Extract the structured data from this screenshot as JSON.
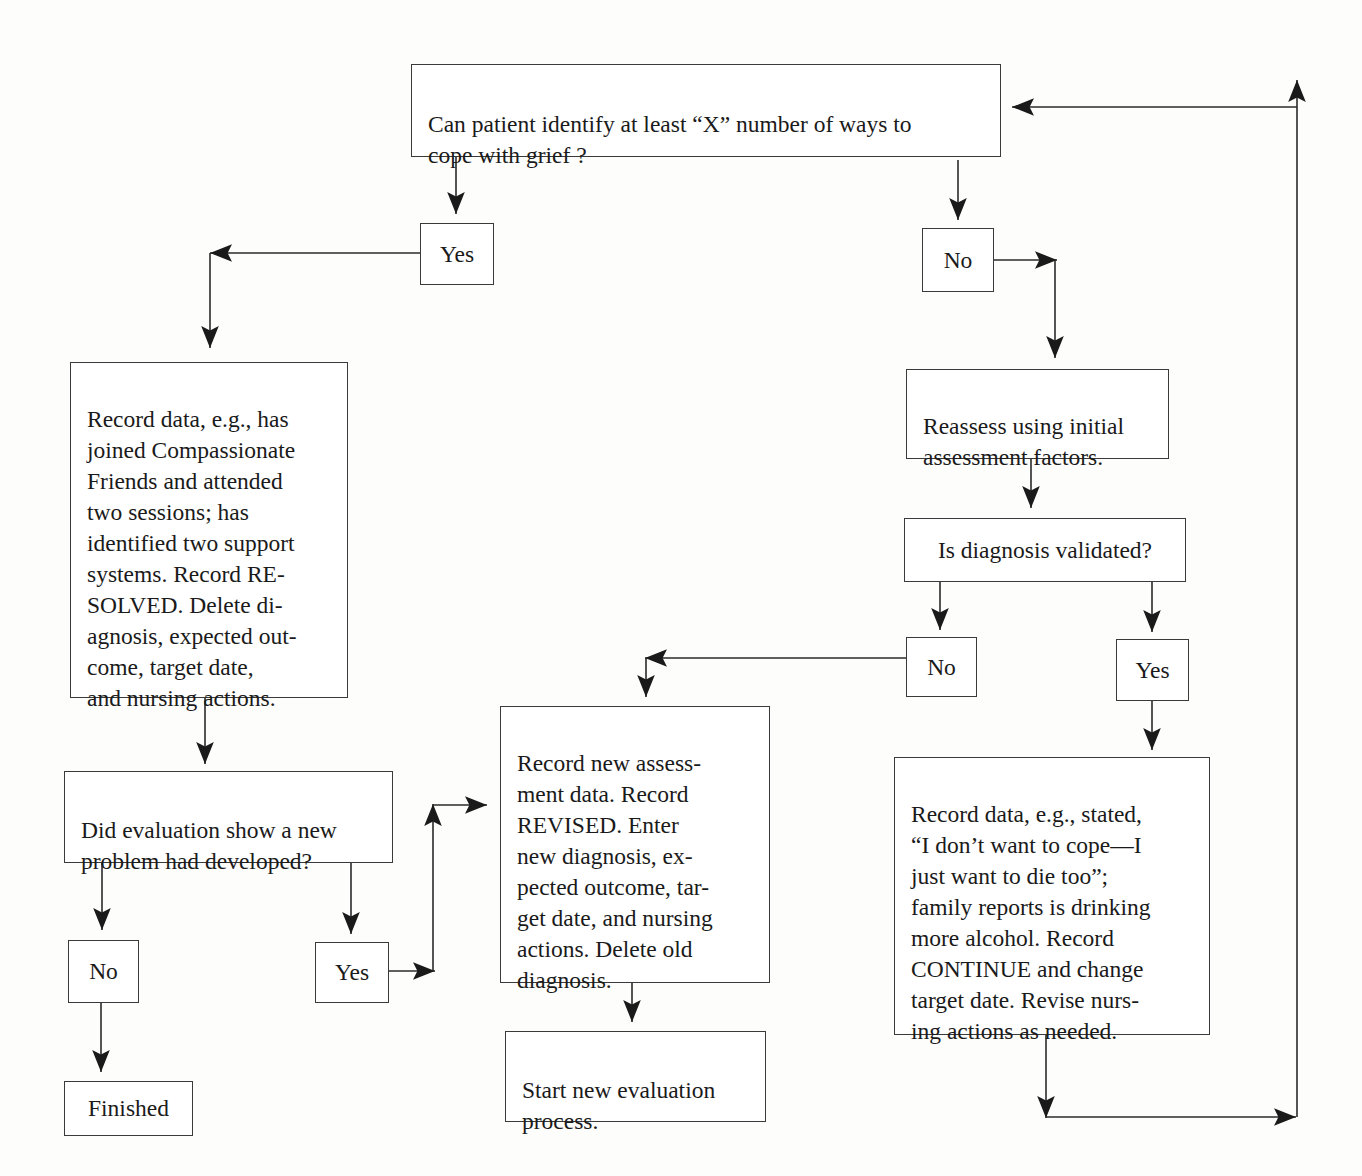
{
  "diagram": {
    "type": "flowchart",
    "line_color": "#2a2a2a",
    "background": "#fdfdfc",
    "nodes": {
      "q1": {
        "text": "Can patient identify at least “X” number of ways to\ncope with grief ?"
      },
      "yes1": {
        "text": "Yes"
      },
      "no1": {
        "text": "No"
      },
      "resolved": {
        "text": "Record data, e.g., has\njoined Compassionate\nFriends and attended\ntwo sessions; has\nidentified two support\nsystems. Record RE-\nSOLVED. Delete di-\nagnosis, expected out-\ncome, target date,\nand nursing actions."
      },
      "reassess": {
        "text": "Reassess using initial\nassessment factors."
      },
      "q_validated": {
        "text": "Is diagnosis validated?"
      },
      "no2": {
        "text": "No"
      },
      "yes2": {
        "text": "Yes"
      },
      "q_newproblem": {
        "text": "Did evaluation show a new\nproblem had developed?"
      },
      "no3": {
        "text": "No"
      },
      "yes3": {
        "text": "Yes"
      },
      "finished": {
        "text": "Finished"
      },
      "revised": {
        "text": "Record new assess-\nment data. Record\nREVISED. Enter\nnew diagnosis, ex-\npected outcome, tar-\nget date, and nursing\nactions. Delete old\ndiagnosis."
      },
      "start_new": {
        "text": "Start new evaluation\nprocess."
      },
      "continue": {
        "text": "Record data, e.g., stated,\n“I don’t want to cope—I\njust want to die too”;\nfamily reports is drinking\nmore alcohol. Record\nCONTINUE and change\ntarget date. Revise nurs-\ning actions as needed."
      }
    },
    "edges": [
      {
        "from": "q1",
        "to": "yes1"
      },
      {
        "from": "q1",
        "to": "no1"
      },
      {
        "from": "yes1",
        "to": "resolved"
      },
      {
        "from": "no1",
        "to": "reassess"
      },
      {
        "from": "reassess",
        "to": "q_validated"
      },
      {
        "from": "q_validated",
        "to": "no2"
      },
      {
        "from": "q_validated",
        "to": "yes2"
      },
      {
        "from": "no2",
        "to": "revised"
      },
      {
        "from": "yes2",
        "to": "continue"
      },
      {
        "from": "resolved",
        "to": "q_newproblem"
      },
      {
        "from": "q_newproblem",
        "to": "no3"
      },
      {
        "from": "q_newproblem",
        "to": "yes3"
      },
      {
        "from": "no3",
        "to": "finished"
      },
      {
        "from": "yes3",
        "to": "revised"
      },
      {
        "from": "revised",
        "to": "start_new"
      },
      {
        "from": "continue",
        "to": "q1"
      }
    ]
  }
}
